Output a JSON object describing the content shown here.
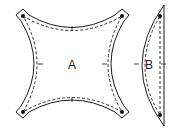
{
  "diagram": {
    "pieces": [
      {
        "id": "A",
        "label": "A",
        "shape": "concave-square"
      },
      {
        "id": "B",
        "label": "B",
        "shape": "half-lens"
      }
    ],
    "colors": {
      "line": "#1a1a1a",
      "background": "#ffffff"
    }
  }
}
